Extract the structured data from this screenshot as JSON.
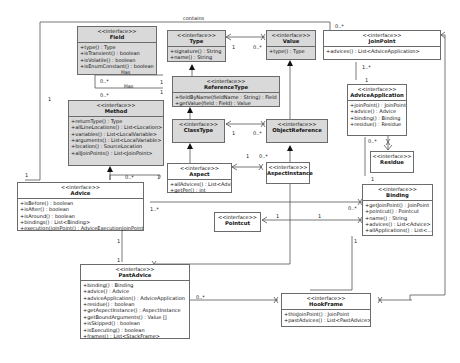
{
  "diagram": {
    "stereotype": "<<interface>>",
    "classes": {
      "field": {
        "name": "Field",
        "ops": [
          "+type() : Type",
          "+isTransient() : boolean",
          "+isVolatile() : boolean",
          "+isEnumConstant() : boolean"
        ]
      },
      "method": {
        "name": "Method",
        "ops": [
          "+returnType() : Type",
          "+allLineLocations() : List<Location>",
          "+variables() : List<LocalVariable>",
          "+arguments() : List<LocalVariable>",
          "+location() : SourceLocation",
          "+allJoinPoints() : List<JoinPoint>"
        ]
      },
      "type": {
        "name": "Type",
        "ops": [
          "+signature() : String",
          "+name() : String"
        ]
      },
      "value": {
        "name": "Value",
        "ops": [
          "+type() : Type"
        ]
      },
      "referenceType": {
        "name": "ReferenceType",
        "ops": [
          "+fieldByName(fieldName : String) : Field",
          "+getValue(field : Field) : Value"
        ]
      },
      "classType": {
        "name": "ClassType",
        "ops": []
      },
      "objectReference": {
        "name": "ObjectReference",
        "ops": []
      },
      "joinPoint": {
        "name": "JoinPoint",
        "ops": [
          "+advices() : List<AdviceApplication>"
        ]
      },
      "adviceApplication": {
        "name": "AdviceApplication",
        "ops": [
          "+joinPoint() : JoinPoint",
          "+advice() : Advice",
          "+binding() : Binding",
          "+residue() : Residue"
        ]
      },
      "residue": {
        "name": "Residue",
        "ops": []
      },
      "aspect": {
        "name": "Aspect",
        "ops": [
          "+allAdvices() : List<Advice>",
          "+getPer() : int"
        ]
      },
      "aspectInstance": {
        "name": "AspectInstance",
        "ops": []
      },
      "advice": {
        "name": "Advice",
        "ops": [
          "+isBefore() : boolean",
          "+isAfter() : boolean",
          "+isAround() : boolean",
          "+bindings() : List<Binding>",
          "+execution(joinPoint() : AdviceExecutionJoinPoint"
        ]
      },
      "binding": {
        "name": "Binding",
        "ops": [
          "+getJoinPoint() : JoinPoint",
          "+pointcut() : Pointcut",
          "+name() : String",
          "+advices() : List<Advice>",
          "+allApplications() : List<..."
        ]
      },
      "pointcut": {
        "name": "Pointcut",
        "ops": []
      },
      "pastAdvice": {
        "name": "PastAdvice",
        "ops": [
          "+binding() : Binding",
          "+advice() : Advice",
          "+adviceApplication() : AdviceApplication",
          "+residue() : boolean",
          "+getAspectInstance() : AspectInstance",
          "+getBoundArguments() : Value []",
          "+isSkipped() : boolean",
          "+isExecuting() : boolean",
          "+frames() : List<StackFrame>"
        ]
      },
      "hookFrame": {
        "name": "HookFrame",
        "ops": [
          "+thisJoinPoint() : JoinPoint",
          "+pastAdvices() : List<PastAdvice>"
        ]
      }
    },
    "labels": {
      "contains": "contains",
      "has1": "Has",
      "has2": "Has",
      "m_field_has": "0..*",
      "m_field_has_ref": "1",
      "m_method_has": "0..*",
      "m_method_has_ref": "1",
      "m_method_left": "1",
      "m_advice_left": "1",
      "m_type_value_type": "1",
      "m_type_value_value": "0..*",
      "m_class_obj_class": "1",
      "m_class_obj_obj": "0..*",
      "m_joinpoint_contains": "0..*",
      "m_jp_app": "1..*",
      "m_app_jp": "1",
      "m_app_residue": "0..*",
      "m_residue_binding": "1",
      "m_aspect_inst_aspect": "1",
      "m_aspect_inst_inst": "0..*",
      "m_advice_aspect_many": "0..*",
      "m_advice_aspect_one": "1",
      "m_advice_binding": "1..*",
      "m_binding_advice": "0..*",
      "m_pointcut": "1",
      "m_binding_pointcut": "1",
      "m_binding_bottom": "1",
      "m_advice_bottom": "1",
      "m_pastadvice_top": "1",
      "m_pastadvice_hook": "0..*"
    }
  }
}
